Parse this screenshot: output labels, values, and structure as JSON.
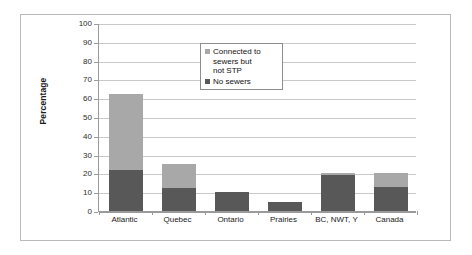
{
  "chart_data": {
    "type": "bar",
    "subtype": "stacked-bar",
    "title": "",
    "xlabel": "",
    "ylabel": "Percentage",
    "ylim": [
      0,
      100
    ],
    "ytick_step": 10,
    "ytick_labels": [
      "100",
      "90",
      "80",
      "70",
      "60",
      "50",
      "40",
      "30",
      "20",
      "10",
      "0"
    ],
    "ytick_values": [
      100,
      90,
      80,
      70,
      60,
      50,
      40,
      30,
      20,
      10,
      0
    ],
    "grid": "horizontal",
    "legend_position": "top-right-inside",
    "categories": [
      "Atlantic",
      "Quebec",
      "Ontario",
      "Prairies",
      "BC, NWT, Y",
      "Canada"
    ],
    "series": [
      {
        "name": "No sewers",
        "color": "#585858",
        "values": [
          22,
          12,
          10,
          5,
          19,
          13
        ]
      },
      {
        "name": "Connected to sewers but not STP",
        "color": "#a8a8a8",
        "values": [
          40,
          13,
          0,
          0,
          1,
          7
        ]
      }
    ],
    "totals": [
      62,
      25,
      10,
      5,
      20,
      20
    ]
  },
  "legend": {
    "entries": [
      {
        "label": "Connected to\nsewers but\nnot STP",
        "color": "#a8a8a8"
      },
      {
        "label": "No sewers",
        "color": "#585858"
      }
    ]
  },
  "axis": {
    "y_title": "Percentage"
  }
}
